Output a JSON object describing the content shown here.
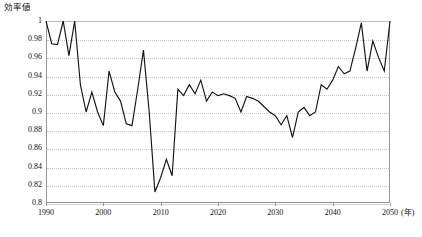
{
  "chart_data": {
    "type": "line",
    "title": "",
    "ylabel": "効率値",
    "xlabel": "(年)",
    "x_unit_label": "(年)",
    "ylim": [
      0.8,
      1.0
    ],
    "xlim": [
      1990,
      2050
    ],
    "y_ticks": [
      "1",
      "0.98",
      "0.96",
      "0.94",
      "0.92",
      "0.9",
      "0.88",
      "0.86",
      "0.84",
      "0.82",
      "0.8"
    ],
    "y_tick_values": [
      1,
      0.98,
      0.96,
      0.94,
      0.92,
      0.9,
      0.88,
      0.86,
      0.84,
      0.82,
      0.8
    ],
    "x_ticks": [
      "1990",
      "2000",
      "2010",
      "2020",
      "2030",
      "2040",
      "2050"
    ],
    "x_tick_values": [
      1990,
      2000,
      2010,
      2020,
      2030,
      2040,
      2050
    ],
    "grid": true,
    "grid_style": "horizontal-dotted",
    "legend": "none",
    "line_color": "#141414",
    "grid_color": "#c8c8c8",
    "axis_color": "#9a9a9a",
    "x": [
      1990,
      1991,
      1992,
      1993,
      1994,
      1995,
      1996,
      1997,
      1998,
      1999,
      2000,
      2001,
      2002,
      2003,
      2004,
      2005,
      2006,
      2007,
      2008,
      2009,
      2010,
      2011,
      2012,
      2013,
      2014,
      2015,
      2016,
      2017,
      2018,
      2019,
      2020,
      2021,
      2022,
      2023,
      2024,
      2025,
      2026,
      2027,
      2028,
      2029,
      2030,
      2031,
      2032,
      2033,
      2034,
      2035,
      2036,
      2037,
      2038,
      2039,
      2040,
      2041,
      2042,
      2043,
      2044,
      2045,
      2046,
      2047,
      2048,
      2049,
      2050
    ],
    "values": [
      1.0,
      0.975,
      0.974,
      1.0,
      0.962,
      1.0,
      0.93,
      0.9,
      0.922,
      0.9,
      0.885,
      0.945,
      0.922,
      0.912,
      0.887,
      0.885,
      0.925,
      0.968,
      0.9,
      0.812,
      0.828,
      0.848,
      0.83,
      0.925,
      0.918,
      0.93,
      0.92,
      0.935,
      0.912,
      0.922,
      0.918,
      0.92,
      0.918,
      0.915,
      0.9,
      0.917,
      0.915,
      0.912,
      0.906,
      0.9,
      0.896,
      0.886,
      0.896,
      0.872,
      0.9,
      0.905,
      0.896,
      0.9,
      0.93,
      0.925,
      0.935,
      0.95,
      0.942,
      0.945,
      0.97,
      0.998,
      0.945,
      0.978,
      0.96,
      0.945,
      1.0
    ]
  },
  "axis_caption": {
    "y": "効率値",
    "x_unit": "(年)"
  }
}
